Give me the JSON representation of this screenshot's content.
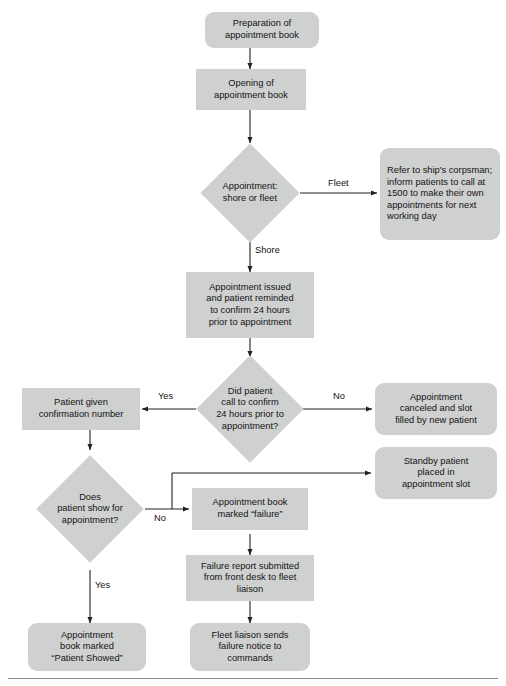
{
  "diagram": {
    "type": "flowchart",
    "fill_color": "#cfd0d0",
    "line_color": "#222222",
    "nodes": [
      {
        "id": "prep",
        "shape": "terminator",
        "label": "Preparation of\nappointment book"
      },
      {
        "id": "opening",
        "shape": "process",
        "label": "Opening of\nappointment book"
      },
      {
        "id": "d_shore",
        "shape": "decision",
        "label": "Appointment:\nshore or fleet"
      },
      {
        "id": "fleet",
        "shape": "terminator",
        "label": "Refer to ship's corpsman;\ninform patients to call at\n1500 to make their own\nappointments for next\nworking day"
      },
      {
        "id": "issued",
        "shape": "process",
        "label": "Appointment issued\nand patient reminded\nto confirm 24 hours\nprior to appointment"
      },
      {
        "id": "d_call",
        "shape": "decision",
        "label": "Did patient\ncall to confirm\n24 hours prior to\nappointment?"
      },
      {
        "id": "confirm",
        "shape": "process",
        "label": "Patient given\nconfirmation number"
      },
      {
        "id": "canceled",
        "shape": "terminator",
        "label": "Appointment\ncanceled and slot\nfilled by new patient"
      },
      {
        "id": "standby",
        "shape": "terminator",
        "label": "Standby patient\nplaced in\nappointment slot"
      },
      {
        "id": "d_show",
        "shape": "decision",
        "label": "Does\npatient show for\nappointment?"
      },
      {
        "id": "failure",
        "shape": "process",
        "label": "Appointment book\nmarked “failure”"
      },
      {
        "id": "report",
        "shape": "process",
        "label": "Failure report submitted\nfrom front desk to fleet\nliaison"
      },
      {
        "id": "notice",
        "shape": "terminator",
        "label": "Fleet liaison sends\nfailure notice to\ncommands"
      },
      {
        "id": "showed",
        "shape": "terminator",
        "label": "Appointment\nbook marked\n“Patient Showed”"
      }
    ],
    "edge_labels": {
      "fleet": "Fleet",
      "shore": "Shore",
      "yes_call": "Yes",
      "no_call": "No",
      "no_show": "No",
      "yes_show": "Yes"
    }
  }
}
